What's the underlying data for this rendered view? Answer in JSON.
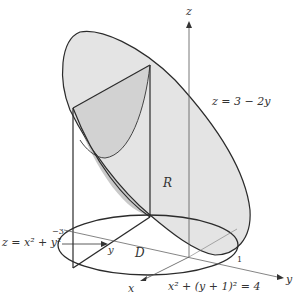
{
  "diagram": {
    "axes": {
      "z_label": "z",
      "y_label": "y",
      "x_label": "x",
      "y_tick_neg": "−3",
      "y_tick_pos": "1"
    },
    "labels": {
      "plane": "z = 3 − 2y",
      "paraboloid": "z = x² + y²",
      "paraboloid_base": "z = x",
      "region_R": "R",
      "region_D": "D",
      "axis_y_mid": "y",
      "circle": "x² + (y + 1)² = 4"
    },
    "colors": {
      "ellipse_fill": "#e3e3e3",
      "shadow_fill": "#c4c4c4",
      "inner_fill": "#d4d4d4",
      "line": "#2b2b2b",
      "axis": "#555555"
    }
  }
}
